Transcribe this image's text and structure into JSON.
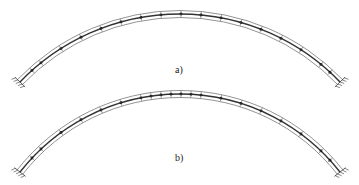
{
  "figure": {
    "panels": [
      {
        "id": "a",
        "label": "a)",
        "arc": {
          "x0": 20,
          "y0": 82,
          "peak_x": 180,
          "peak_y": 14,
          "x1": 340,
          "y1": 82
        },
        "node_x": [
          32,
          41,
          61,
          81,
          101,
          121,
          141,
          161,
          181,
          201,
          221,
          241,
          261,
          281,
          301,
          321,
          330
        ]
      },
      {
        "id": "b",
        "label": "b)",
        "arc": {
          "x0": 20,
          "y0": 172,
          "peak_x": 180,
          "peak_y": 94,
          "x1": 340,
          "y1": 172
        },
        "node_x": [
          32,
          41,
          61,
          81,
          101,
          121,
          141,
          151,
          161,
          171,
          181,
          191,
          201,
          221,
          241,
          261,
          281,
          301,
          321,
          330
        ]
      }
    ],
    "colors": {
      "line": "#333333",
      "rail": "#666666",
      "node": "#111111",
      "background": "#ffffff"
    }
  }
}
